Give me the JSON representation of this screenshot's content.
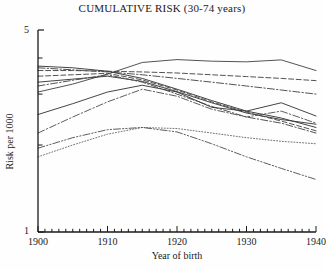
{
  "figure": {
    "title": "CUMULATIVE RISK (30-74 years)",
    "xlabel": "Year of birth",
    "ylabel": "Risk per 1000",
    "ytick_top": "5",
    "ytick_bottom": "1"
  },
  "chart_data": {
    "type": "line",
    "title": "CUMULATIVE RISK (30-74 years)",
    "xlabel": "Year of birth",
    "ylabel": "Risk per 1000",
    "xlim": [
      1900,
      1940
    ],
    "ylim": [
      1,
      5
    ],
    "yscale": "log",
    "grid": false,
    "legend": "none",
    "xticks": [
      1900,
      1910,
      1920,
      1930,
      1940
    ],
    "xtick_labels": [
      "1900",
      "1910",
      "1920",
      "1930",
      "1940"
    ],
    "xminor_tick_interval": 1,
    "yticks": [
      1,
      5
    ],
    "ytick_labels": [
      "1",
      "5"
    ],
    "yminor_ticks": [
      2,
      3,
      4
    ],
    "x": [
      1900,
      1905,
      1910,
      1915,
      1920,
      1925,
      1930,
      1935,
      1940
    ],
    "series": [
      {
        "name": "series-1",
        "style": "solid",
        "color": "#4a4a4a",
        "values": [
          3.05,
          3.25,
          3.52,
          3.86,
          3.95,
          3.9,
          3.88,
          3.94,
          3.62
        ]
      },
      {
        "name": "series-2",
        "style": "dashed",
        "color": "#4a4a4a",
        "values": [
          3.62,
          3.62,
          3.6,
          3.58,
          3.55,
          3.5,
          3.45,
          3.4,
          3.34
        ]
      },
      {
        "name": "series-3",
        "style": "dashdot",
        "color": "#4a4a4a",
        "values": [
          3.7,
          3.64,
          3.58,
          3.5,
          3.4,
          3.3,
          3.2,
          3.1,
          3.0
        ]
      },
      {
        "name": "series-4",
        "style": "solid",
        "color": "#3a3a3a",
        "values": [
          3.75,
          3.7,
          3.6,
          3.4,
          3.12,
          2.85,
          2.62,
          2.48,
          2.3
        ]
      },
      {
        "name": "series-5",
        "style": "solid",
        "color": "#3a3a3a",
        "values": [
          3.3,
          3.38,
          3.46,
          3.32,
          3.06,
          2.8,
          2.58,
          2.45,
          2.36
        ]
      },
      {
        "name": "series-6",
        "style": "dashed",
        "color": "#4a4a4a",
        "values": [
          3.46,
          3.5,
          3.54,
          3.36,
          3.1,
          2.82,
          2.6,
          2.42,
          2.24
        ]
      },
      {
        "name": "series-7",
        "style": "dashdot",
        "color": "#4a4a4a",
        "values": [
          3.2,
          3.35,
          3.5,
          3.3,
          3.0,
          2.72,
          2.5,
          2.38,
          2.2
        ]
      },
      {
        "name": "series-8",
        "style": "solid",
        "color": "#3a3a3a",
        "values": [
          2.55,
          2.78,
          3.05,
          3.22,
          3.05,
          2.7,
          2.62,
          2.8,
          2.52
        ]
      },
      {
        "name": "series-9",
        "style": "dashdot",
        "color": "#555555",
        "values": [
          2.2,
          2.5,
          2.82,
          3.12,
          2.95,
          2.66,
          2.5,
          2.62,
          2.38
        ]
      },
      {
        "name": "series-10",
        "style": "dotted",
        "color": "#6a6a6a",
        "values": [
          1.82,
          2.0,
          2.18,
          2.3,
          2.28,
          2.2,
          2.12,
          2.06,
          2.02
        ]
      },
      {
        "name": "series-11",
        "style": "dashdotdot",
        "color": "#555555",
        "values": [
          1.95,
          2.12,
          2.26,
          2.3,
          2.22,
          2.02,
          1.82,
          1.66,
          1.52
        ]
      }
    ]
  }
}
